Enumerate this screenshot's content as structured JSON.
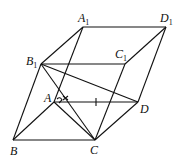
{
  "figure": {
    "type": "parallelepiped",
    "vertices": {
      "A1": {
        "x": 83,
        "y": 27
      },
      "D1": {
        "x": 166,
        "y": 27
      },
      "B1": {
        "x": 41,
        "y": 64
      },
      "C1": {
        "x": 125,
        "y": 64
      },
      "A": {
        "x": 54,
        "y": 102
      },
      "D": {
        "x": 138,
        "y": 102
      },
      "B": {
        "x": 13,
        "y": 140
      },
      "C": {
        "x": 95,
        "y": 140
      }
    },
    "labels": {
      "A1": {
        "main": "A",
        "sub": "1"
      },
      "D1": {
        "main": "D",
        "sub": "1"
      },
      "B1": {
        "main": "B",
        "sub": "1"
      },
      "C1": {
        "main": "C",
        "sub": "1"
      },
      "A": {
        "main": "A"
      },
      "D": {
        "main": "D"
      },
      "B": {
        "main": "B"
      },
      "C": {
        "main": "C"
      }
    },
    "edges": [
      [
        "A1",
        "D1"
      ],
      [
        "A1",
        "B1"
      ],
      [
        "D1",
        "C1"
      ],
      [
        "B1",
        "C1"
      ],
      [
        "B1",
        "B"
      ],
      [
        "A1",
        "A"
      ],
      [
        "C1",
        "C"
      ],
      [
        "D1",
        "D"
      ],
      [
        "A",
        "D"
      ],
      [
        "B",
        "C"
      ],
      [
        "A",
        "B"
      ],
      [
        "D",
        "C"
      ],
      [
        "B1",
        "D"
      ],
      [
        "B1",
        "C"
      ],
      [
        "A",
        "C"
      ]
    ],
    "marks": {
      "right_angle_at": "A",
      "angle_mark_at": "A",
      "tick_on_edge": [
        "A",
        "D"
      ]
    },
    "color": "#111111"
  }
}
